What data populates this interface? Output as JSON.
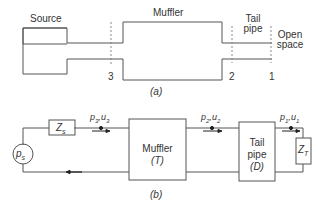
{
  "part_a": {
    "caption": "(a)",
    "labels": {
      "source": "Source",
      "muffler": "Muffler",
      "tail_pipe_line1": "Tail",
      "tail_pipe_line2": "pipe",
      "open_space_line1": "Open",
      "open_space_line2": "space"
    },
    "stations": [
      "3",
      "2",
      "1"
    ]
  },
  "part_b": {
    "caption": "(b)",
    "source": {
      "symbol": "p",
      "subscript": "s"
    },
    "source_impedance": {
      "symbol": "Z",
      "subscript": "s"
    },
    "muffler_block": {
      "line1": "Muffler",
      "line2": "(T)"
    },
    "tail_pipe_block": {
      "line1": "Tail",
      "line2": "pipe",
      "line3": "(D)"
    },
    "terminal_impedance": {
      "symbol": "Z",
      "subscript": "T"
    },
    "state_labels": {
      "s3": {
        "p": "p",
        "ps": "3",
        "u": "u",
        "us": "3"
      },
      "s2": {
        "p": "p",
        "ps": "2",
        "u": "u",
        "us": "2"
      },
      "s1": {
        "p": "p",
        "ps": "1",
        "u": "u",
        "us": "1"
      }
    }
  },
  "colors": {
    "line": "#555555",
    "dashed": "#888888",
    "text": "#333333"
  }
}
